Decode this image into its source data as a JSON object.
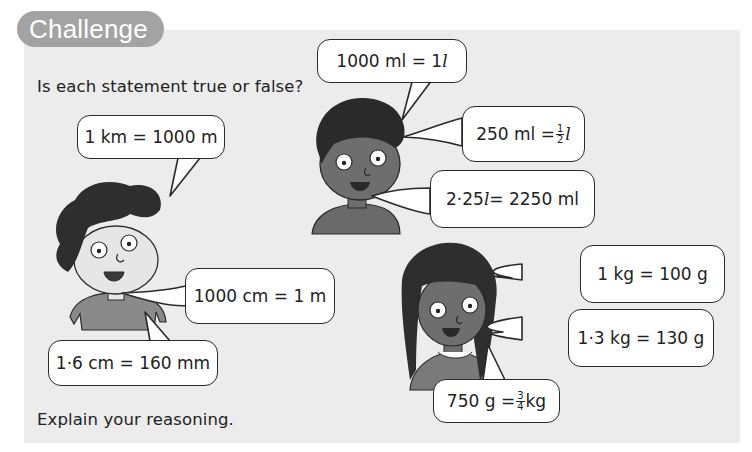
{
  "title": "Challenge",
  "instructions": {
    "question": "Is each statement true or false?",
    "footer": "Explain your reasoning."
  },
  "characters": [
    {
      "name": "boy-left",
      "statements": [
        "1 km = 1000 m",
        "1000 cm = 1 m",
        "1·6 cm = 160 mm"
      ]
    },
    {
      "name": "boy-middle",
      "statements": [
        "1000 ml = 1 l",
        "250 ml = 1/2 l",
        "2·25 l = 2250 ml"
      ]
    },
    {
      "name": "girl-right",
      "statements": [
        "1 kg = 100 g",
        "1·3 kg = 130 g",
        "750 g = 3/4 kg"
      ]
    }
  ],
  "bubbles": {
    "km": {
      "a": "1 km = 1000 m"
    },
    "cm": {
      "a": "1000 cm = 1 m"
    },
    "mm": {
      "a": "1·6 cm = 160 mm"
    },
    "ml1": {
      "a": "1000 ml = 1 ",
      "unit": "l"
    },
    "ml2": {
      "a": "250 ml = ",
      "num": "1",
      "den": "2",
      "unit": "l"
    },
    "ml3": {
      "a": "2·25 ",
      "unit": "l",
      "b": " = 2250 ml"
    },
    "kg1": {
      "a": "1 kg = 100 g"
    },
    "kg2": {
      "a": "1·3 kg = 130 g"
    },
    "kg3": {
      "a": "750 g = ",
      "num": "3",
      "den": "4",
      "b": "kg"
    }
  },
  "colors": {
    "panel": "#ececec",
    "title_pill": "#a3a3a3",
    "hair": "#2e2e2e",
    "skin_light": "#e6e6e6",
    "skin_dark": "#6e6e6e",
    "shirt": "#8a8a8a"
  }
}
